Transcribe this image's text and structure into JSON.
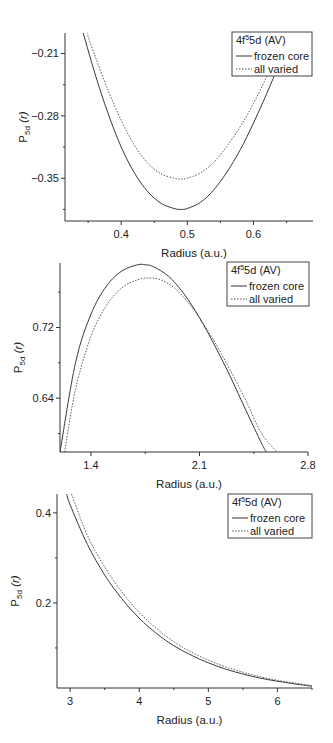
{
  "chart_data": [
    {
      "type": "line",
      "title": "",
      "xlabel": "Radius (a.u.)",
      "ylabel": "P5d (r)",
      "xlim": [
        0.315,
        0.69
      ],
      "ylim": [
        -0.398,
        -0.187
      ],
      "xticks": [
        0.4,
        0.5,
        0.6
      ],
      "xtick_labels": [
        "0.4",
        "0.5",
        "0.6"
      ],
      "yticks": [
        -0.21,
        -0.28,
        -0.35
      ],
      "ytick_labels": [
        "-0.21",
        "-0.28",
        "-0.35"
      ],
      "grid": false,
      "legend": {
        "title": "4f55d (AV)",
        "title_base": "4f",
        "title_sup": "5",
        "title_rest": "5d (AV)",
        "position": "upper right",
        "entries": [
          "frozen core",
          "all varied"
        ]
      },
      "series": [
        {
          "name": "frozen core",
          "style": "solid",
          "x": [
            0.34,
            0.36,
            0.38,
            0.4,
            0.42,
            0.44,
            0.46,
            0.48,
            0.49,
            0.5,
            0.52,
            0.54,
            0.56,
            0.58,
            0.6,
            0.62,
            0.64,
            0.66
          ],
          "y": [
            -0.18,
            -0.232,
            -0.277,
            -0.315,
            -0.344,
            -0.365,
            -0.378,
            -0.384,
            -0.385,
            -0.384,
            -0.377,
            -0.363,
            -0.343,
            -0.318,
            -0.288,
            -0.255,
            -0.22,
            -0.185
          ]
        },
        {
          "name": "all varied",
          "style": "dotted",
          "x": [
            0.345,
            0.36,
            0.38,
            0.4,
            0.42,
            0.44,
            0.46,
            0.48,
            0.49,
            0.5,
            0.52,
            0.54,
            0.56,
            0.58,
            0.6,
            0.62,
            0.64,
            0.66
          ],
          "y": [
            -0.18,
            -0.212,
            -0.251,
            -0.285,
            -0.313,
            -0.333,
            -0.345,
            -0.35,
            -0.351,
            -0.35,
            -0.344,
            -0.332,
            -0.314,
            -0.292,
            -0.266,
            -0.236,
            -0.205,
            -0.172
          ]
        }
      ]
    },
    {
      "type": "line",
      "title": "",
      "xlabel": "Radius (a.u.)",
      "ylabel": "P5d (r)",
      "xlim": [
        1.2,
        2.8
      ],
      "ylim": [
        0.579,
        0.793
      ],
      "xticks": [
        1.4,
        2.1,
        2.8
      ],
      "xtick_labels": [
        "1.4",
        "2.1",
        "2.8"
      ],
      "yticks": [
        0.72,
        0.64
      ],
      "ytick_labels": [
        "0.72",
        "0.64"
      ],
      "grid": false,
      "legend": {
        "title": "4f55d (AV)",
        "title_base": "4f",
        "title_sup": "5",
        "title_rest": "5d (AV)",
        "position": "upper right",
        "entries": [
          "frozen core",
          "all varied"
        ]
      },
      "series": [
        {
          "name": "frozen core",
          "style": "solid",
          "x": [
            1.2,
            1.3,
            1.4,
            1.5,
            1.6,
            1.7,
            1.75,
            1.8,
            1.9,
            2.0,
            2.1,
            2.2,
            2.3,
            2.4,
            2.5,
            2.53
          ],
          "y": [
            0.579,
            0.68,
            0.735,
            0.767,
            0.784,
            0.791,
            0.791,
            0.789,
            0.778,
            0.758,
            0.731,
            0.699,
            0.664,
            0.626,
            0.589,
            0.579
          ]
        },
        {
          "name": "all varied",
          "style": "dotted",
          "x": [
            1.23,
            1.3,
            1.4,
            1.5,
            1.6,
            1.7,
            1.77,
            1.85,
            1.95,
            2.05,
            2.1,
            2.2,
            2.3,
            2.4,
            2.5,
            2.6
          ],
          "y": [
            0.579,
            0.65,
            0.71,
            0.745,
            0.765,
            0.774,
            0.776,
            0.774,
            0.763,
            0.743,
            0.731,
            0.703,
            0.671,
            0.637,
            0.6,
            0.579
          ]
        }
      ]
    },
    {
      "type": "line",
      "title": "",
      "xlabel": "Radius (a.u.)",
      "ylabel": "P5d (r)",
      "xlim": [
        2.81,
        6.5
      ],
      "ylim": [
        0.011,
        0.442
      ],
      "xticks": [
        3,
        4,
        5,
        6
      ],
      "xtick_labels": [
        "3",
        "4",
        "5",
        "6"
      ],
      "yticks": [
        0.4,
        0.2
      ],
      "ytick_labels": [
        "0.4",
        "0.2"
      ],
      "grid": false,
      "legend": {
        "title": "4f55d (AV)",
        "title_base": "4f",
        "title_sup": "5",
        "title_rest": "5d (AV)",
        "position": "upper right",
        "entries": [
          "frozen core",
          "all varied"
        ]
      },
      "series": [
        {
          "name": "frozen core",
          "style": "solid",
          "x": [
            2.95,
            3.0,
            3.25,
            3.5,
            3.75,
            4.0,
            4.25,
            4.5,
            4.75,
            5.0,
            5.25,
            5.5,
            5.75,
            6.0,
            6.25,
            6.5
          ],
          "y": [
            0.442,
            0.418,
            0.33,
            0.262,
            0.209,
            0.166,
            0.132,
            0.105,
            0.084,
            0.067,
            0.053,
            0.042,
            0.033,
            0.026,
            0.02,
            0.015
          ]
        },
        {
          "name": "all varied",
          "style": "dotted",
          "x": [
            3.02,
            3.25,
            3.5,
            3.75,
            4.0,
            4.25,
            4.5,
            4.75,
            5.0,
            5.25,
            5.5,
            5.75,
            6.0,
            6.25,
            6.5
          ],
          "y": [
            0.442,
            0.35,
            0.28,
            0.224,
            0.179,
            0.143,
            0.114,
            0.091,
            0.073,
            0.058,
            0.046,
            0.036,
            0.028,
            0.022,
            0.016
          ]
        }
      ]
    }
  ],
  "panels": [
    {
      "xlabel": "Radius (a.u.)",
      "ylabel_base": "P",
      "ylabel_sub": "5d",
      "ylabel_rest": " (r)"
    },
    {
      "xlabel": "Radius (a.u.)",
      "ylabel_base": "P",
      "ylabel_sub": "5d",
      "ylabel_rest": " (r)"
    },
    {
      "xlabel": "Radius (a.u.)",
      "ylabel_base": "P",
      "ylabel_sub": "5d",
      "ylabel_rest": " (r)"
    }
  ],
  "legend": {
    "title_base": "4f",
    "title_sup": "5",
    "title_rest": "5d (AV)",
    "frozen": "frozen core",
    "varied": "all varied"
  }
}
